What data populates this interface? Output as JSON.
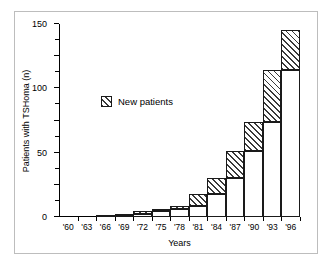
{
  "figure": {
    "frame_color": "#bdbdbd",
    "background": "#ffffff"
  },
  "legend": {
    "label": "New patients",
    "swatch": "hatched-square"
  },
  "chart_data": {
    "type": "bar",
    "title": "",
    "subtitle": "",
    "xlabel": "Years",
    "ylabel": "Patients with TSHoma (n)",
    "categories": [
      "'60",
      "'63",
      "'66",
      "'69",
      "'72",
      "'75",
      "'78",
      "'81",
      "'84",
      "'87",
      "'90",
      "'93",
      "'96"
    ],
    "ylim": [
      0,
      300
    ],
    "yticks": [
      0,
      50,
      100,
      150,
      200,
      250,
      300
    ],
    "ytick_labels": [
      "0",
      "50",
      "100",
      "150",
      "200",
      "250",
      "300"
    ],
    "yminor_step": 25,
    "grid": false,
    "legend_position": "inside-upper-left",
    "stacked": true,
    "stack_note": "Each bar is the cumulative total; the white lower segment equals the previous bar's cumulative total and the hatched upper segment is new patients for that interval.",
    "series": [
      {
        "name": "Cumulative previous patients",
        "fill": "solid-white",
        "values": [
          0,
          0,
          0,
          2,
          4,
          10,
          12,
          17,
          36,
          61,
          102,
          147,
          229
        ]
      },
      {
        "name": "New patients",
        "fill": "hatched",
        "values": [
          0,
          0,
          2,
          2,
          6,
          2,
          5,
          19,
          25,
          41,
          45,
          82,
          61
        ]
      }
    ],
    "cumulative_totals": [
      0,
      0,
      2,
      4,
      10,
      12,
      17,
      36,
      61,
      102,
      147,
      229,
      290
    ]
  }
}
